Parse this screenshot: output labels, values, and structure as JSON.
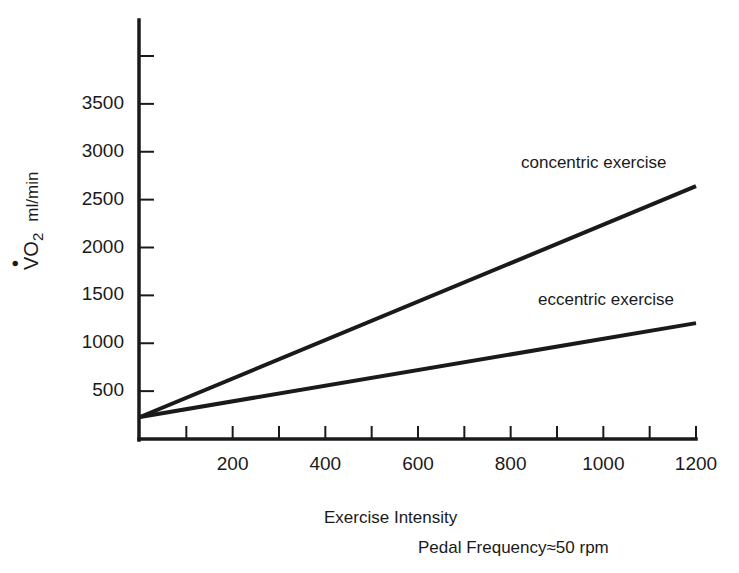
{
  "chart_data": {
    "type": "line",
    "title": "",
    "xlabel": "Exercise Intensity",
    "subtitle": "Pedal Frequency≈50 rpm",
    "ylabel": "V̇O2 ml/min",
    "ylabel_parts": {
      "main": "VO",
      "sub": "2",
      "unit": "ml/min"
    },
    "xlim": [
      0,
      1200
    ],
    "ylim": [
      0,
      4000
    ],
    "x_ticks": [
      200,
      400,
      600,
      800,
      1000,
      1200
    ],
    "x_tick_labels": [
      "200",
      "400",
      "600",
      "800",
      "1000",
      "1200"
    ],
    "x_minor_ticks": [
      100,
      200,
      300,
      400,
      500,
      600,
      700,
      800,
      900,
      1000,
      1100,
      1200
    ],
    "y_ticks": [
      500,
      1000,
      1500,
      2000,
      2500,
      3000,
      3500,
      4000
    ],
    "y_tick_labels": [
      "500",
      "1000",
      "1500",
      "2000",
      "2500",
      "3000",
      "3500",
      ""
    ],
    "grid": false,
    "legend": "inline labels at line ends",
    "series": [
      {
        "name": "concentric exercise",
        "x": [
          0,
          1200
        ],
        "values": [
          230,
          2640
        ]
      },
      {
        "name": "eccentric exercise",
        "x": [
          0,
          1200
        ],
        "values": [
          230,
          1210
        ]
      }
    ]
  },
  "labels": {
    "y_ticks": [
      "500",
      "1000",
      "1500",
      "2000",
      "2500",
      "3000",
      "3500"
    ],
    "x_ticks": [
      "200",
      "400",
      "600",
      "800",
      "1000",
      "1200"
    ],
    "concentric": "concentric exercise",
    "eccentric": "eccentric exercise",
    "xlabel": "Exercise Intensity",
    "subtitle": "Pedal Frequency≈50 rpm",
    "ylabel_main": "VO",
    "ylabel_sub": "2",
    "ylabel_unit": "ml/min"
  },
  "colors": {
    "ink": "#1a1a1a",
    "background": "#ffffff"
  }
}
